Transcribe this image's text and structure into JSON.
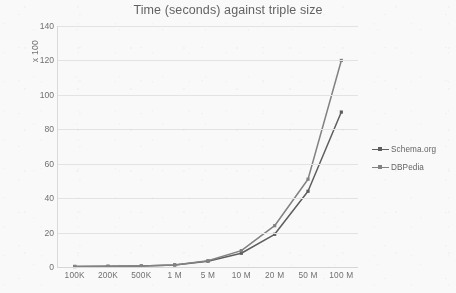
{
  "chart_data": {
    "type": "line",
    "title": "Time (seconds) against triple size",
    "xlabel": "",
    "ylabel": "x 100",
    "categories": [
      "100K",
      "200K",
      "500K",
      "1 M",
      "5 M",
      "10 M",
      "20 M",
      "50 M",
      "100 M"
    ],
    "ylim": [
      0,
      140
    ],
    "ytick_values": [
      0,
      20,
      40,
      60,
      80,
      100,
      120,
      140
    ],
    "ytick_labels": [
      "0",
      "20",
      "40",
      "60",
      "80",
      "100",
      "120",
      "140"
    ],
    "grid": "horizontal",
    "legend_position": "right",
    "series": [
      {
        "name": "Schema.org",
        "color": "#595959",
        "marker": "square",
        "values": [
          0.3,
          0.4,
          0.6,
          1.2,
          3.4,
          8,
          19,
          44,
          90
        ]
      },
      {
        "name": "DBPedia",
        "color": "#7f7f7f",
        "marker": "square",
        "values": [
          0.3,
          0.4,
          0.6,
          1.2,
          3.6,
          9.5,
          24,
          51,
          120
        ]
      }
    ]
  },
  "colors": {
    "gridline": "#e6e6e6",
    "axis": "#dcdcdc",
    "text": "#6d6d6d",
    "background": "#fdfdfd"
  }
}
